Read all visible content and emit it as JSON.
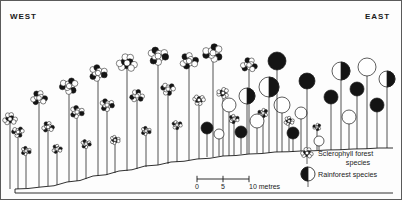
{
  "figure": {
    "orientation": {
      "west_label": "WEST",
      "east_label": "EAST"
    },
    "ground": {
      "name": "ground-profile",
      "description": "terrain rising from west to east"
    }
  },
  "scale_bar": {
    "ticks": [
      "0",
      "5",
      "10 metres"
    ],
    "tick_values": [
      0,
      5,
      10
    ],
    "unit": "metres"
  },
  "legend": {
    "items": [
      {
        "symbol": "cluster-crown-tree",
        "label_line1": "Sclerophyll forest",
        "label_line2": "species"
      },
      {
        "symbol": "half-filled-circle-tree",
        "label_line1": "Rainforest species",
        "label_line2": ""
      }
    ]
  },
  "colors": {
    "ink": "#1a1a1a",
    "fill_dark": "#141414",
    "fill_light": "#ffffff",
    "frame": "#5a5a5a",
    "background": "#fdfdfd"
  },
  "chart_data": {
    "type": "scatter",
    "title": "",
    "subtitle": "",
    "xlabel": "",
    "ylabel": "",
    "grid": false,
    "legend_position": "bottom-right",
    "axis_note": "x = horizontal distance west to east; y = tree height above ground",
    "ground_profile_points": [
      [
        14,
        188
      ],
      [
        40,
        186
      ],
      [
        66,
        181
      ],
      [
        92,
        175
      ],
      [
        118,
        170
      ],
      [
        144,
        165
      ],
      [
        170,
        161
      ],
      [
        196,
        158
      ],
      [
        222,
        155
      ],
      [
        248,
        153
      ],
      [
        274,
        151
      ],
      [
        300,
        150
      ],
      [
        326,
        149
      ],
      [
        352,
        148
      ],
      [
        378,
        147
      ],
      [
        392,
        147
      ]
    ],
    "series": [
      {
        "name": "Sclerophyll forest species",
        "symbol": "cluster-crown",
        "trees": [
          {
            "x": 9,
            "base": 188,
            "crown_y": 118,
            "crown_r": 7
          },
          {
            "x": 17,
            "base": 188,
            "crown_y": 131,
            "crown_r": 6
          },
          {
            "x": 25,
            "base": 187,
            "crown_y": 150,
            "crown_r": 5
          },
          {
            "x": 38,
            "base": 186,
            "crown_y": 97,
            "crown_r": 8
          },
          {
            "x": 47,
            "base": 185,
            "crown_y": 126,
            "crown_r": 6
          },
          {
            "x": 56,
            "base": 184,
            "crown_y": 148,
            "crown_r": 5
          },
          {
            "x": 68,
            "base": 181,
            "crown_y": 85,
            "crown_r": 9
          },
          {
            "x": 76,
            "base": 180,
            "crown_y": 111,
            "crown_r": 7
          },
          {
            "x": 85,
            "base": 178,
            "crown_y": 143,
            "crown_r": 5
          },
          {
            "x": 97,
            "base": 175,
            "crown_y": 72,
            "crown_r": 9
          },
          {
            "x": 106,
            "base": 174,
            "crown_y": 104,
            "crown_r": 7
          },
          {
            "x": 114,
            "base": 172,
            "crown_y": 139,
            "crown_r": 5
          },
          {
            "x": 126,
            "base": 170,
            "crown_y": 62,
            "crown_r": 10
          },
          {
            "x": 136,
            "base": 168,
            "crown_y": 95,
            "crown_r": 7
          },
          {
            "x": 145,
            "base": 166,
            "crown_y": 130,
            "crown_r": 5
          },
          {
            "x": 157,
            "base": 164,
            "crown_y": 55,
            "crown_r": 10
          },
          {
            "x": 167,
            "base": 163,
            "crown_y": 88,
            "crown_r": 7
          },
          {
            "x": 176,
            "base": 161,
            "crown_y": 124,
            "crown_r": 5
          },
          {
            "x": 188,
            "base": 159,
            "crown_y": 60,
            "crown_r": 9
          },
          {
            "x": 198,
            "base": 158,
            "crown_y": 99,
            "crown_r": 6
          },
          {
            "x": 212,
            "base": 156,
            "crown_y": 52,
            "crown_r": 10
          },
          {
            "x": 222,
            "base": 155,
            "crown_y": 92,
            "crown_r": 6
          },
          {
            "x": 233,
            "base": 154,
            "crown_y": 118,
            "crown_r": 5
          },
          {
            "x": 248,
            "base": 153,
            "crown_y": 64,
            "crown_r": 8
          },
          {
            "x": 262,
            "base": 152,
            "crown_y": 112,
            "crown_r": 5
          },
          {
            "x": 288,
            "base": 150,
            "crown_y": 120,
            "crown_r": 5
          },
          {
            "x": 316,
            "base": 149,
            "crown_y": 126,
            "crown_r": 4
          }
        ]
      },
      {
        "name": "Rainforest species",
        "symbol": "large-circle",
        "trees": [
          {
            "x": 206,
            "base": 156,
            "crown_y": 127,
            "crown_r": 6,
            "fill": "dark"
          },
          {
            "x": 218,
            "base": 155,
            "crown_y": 133,
            "crown_r": 5,
            "fill": "light"
          },
          {
            "x": 240,
            "base": 153,
            "crown_y": 131,
            "crown_r": 6,
            "fill": "dark"
          },
          {
            "x": 256,
            "base": 152,
            "crown_y": 120,
            "crown_r": 7,
            "fill": "light"
          },
          {
            "x": 268,
            "base": 152,
            "crown_y": 86,
            "crown_r": 10,
            "fill": "split"
          },
          {
            "x": 281,
            "base": 151,
            "crown_y": 104,
            "crown_r": 8,
            "fill": "light"
          },
          {
            "x": 292,
            "base": 151,
            "crown_y": 132,
            "crown_r": 6,
            "fill": "dark"
          },
          {
            "x": 300,
            "base": 150,
            "crown_y": 112,
            "crown_r": 6,
            "fill": "light"
          },
          {
            "x": 306,
            "base": 150,
            "crown_y": 80,
            "crown_r": 8,
            "fill": "dark"
          },
          {
            "x": 318,
            "base": 149,
            "crown_y": 140,
            "crown_r": 5,
            "fill": "light"
          },
          {
            "x": 330,
            "base": 149,
            "crown_y": 96,
            "crown_r": 7,
            "fill": "dark"
          },
          {
            "x": 340,
            "base": 149,
            "crown_y": 70,
            "crown_r": 9,
            "fill": "split"
          },
          {
            "x": 348,
            "base": 148,
            "crown_y": 116,
            "crown_r": 7,
            "fill": "light"
          },
          {
            "x": 356,
            "base": 148,
            "crown_y": 88,
            "crown_r": 7,
            "fill": "dark"
          },
          {
            "x": 366,
            "base": 148,
            "crown_y": 66,
            "crown_r": 9,
            "fill": "light"
          },
          {
            "x": 376,
            "base": 147,
            "crown_y": 104,
            "crown_r": 7,
            "fill": "dark"
          },
          {
            "x": 386,
            "base": 147,
            "crown_y": 78,
            "crown_r": 8,
            "fill": "split"
          },
          {
            "x": 228,
            "base": 155,
            "crown_y": 104,
            "crown_r": 7,
            "fill": "light"
          },
          {
            "x": 246,
            "base": 153,
            "crown_y": 95,
            "crown_r": 8,
            "fill": "split"
          },
          {
            "x": 276,
            "base": 151,
            "crown_y": 60,
            "crown_r": 9,
            "fill": "dark"
          }
        ]
      }
    ]
  }
}
